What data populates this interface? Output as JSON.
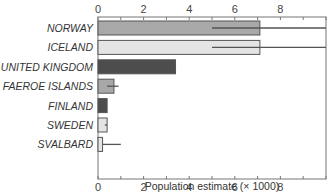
{
  "chart_data": {
    "type": "bar",
    "orientation": "horizontal",
    "title": "",
    "xlabel": "Population estimate (× 1000)",
    "ylabel": "",
    "xlim": [
      0,
      10
    ],
    "x_ticks": [
      0,
      2,
      4,
      6,
      8
    ],
    "x_ticks_top": [
      0,
      2,
      4,
      6,
      8
    ],
    "grid": false,
    "categories": [
      "NORWAY",
      "ICELAND",
      "UNITED KINGDOM",
      "FAEROE ISLANDS",
      "FINLAND",
      "SWEDEN",
      "SVALBARD"
    ],
    "values": [
      7.1,
      7.1,
      3.4,
      0.7,
      0.4,
      0.4,
      0.2
    ],
    "error_low": [
      5.0,
      5.0,
      null,
      0.4,
      null,
      0.3,
      0.2
    ],
    "error_high": [
      10.0,
      10.0,
      null,
      0.9,
      null,
      0.4,
      1.0
    ],
    "bar_colors": [
      "#a8a8a8",
      "#e4e4e4",
      "#4d4d4d",
      "#a8a8a8",
      "#4d4d4d",
      "#e4e4e4",
      "#e4e4e4"
    ]
  }
}
